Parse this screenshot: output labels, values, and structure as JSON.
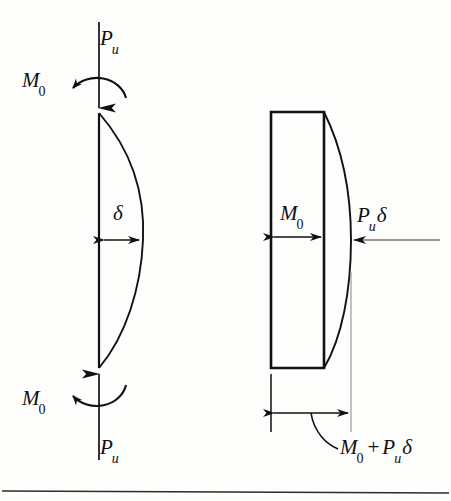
{
  "figure": {
    "background_color": "#fdfdfc",
    "ink_color": "#111111",
    "guide_color": "#9a9a9a",
    "labels": {
      "axial_load_top": "P",
      "axial_load_top_sub": "u",
      "end_moment_top": "M",
      "end_moment_top_sub": "0",
      "deflection": "δ",
      "end_moment_bottom": "M",
      "end_moment_bottom_sub": "0",
      "axial_load_bottom": "P",
      "axial_load_bottom_sub": "u",
      "primary_moment": "M",
      "primary_moment_sub": "0",
      "secondary_moment": "P",
      "secondary_moment_sub": "u",
      "secondary_moment_tail": "δ",
      "total_moment_first": "M",
      "total_moment_first_sub": "0",
      "total_moment_operator": "+",
      "total_moment_second": "P",
      "total_moment_second_sub": "u",
      "total_moment_tail": "δ"
    },
    "left_diagram": {
      "name": "deflected-column",
      "axis_x": 99,
      "top_y": 113,
      "bottom_y": 368,
      "max_bulge_x": 143,
      "deflection_arrow_y": 240
    },
    "right_diagram": {
      "name": "moment-diagram",
      "block_left_x": 271,
      "block_right_x": 324,
      "block_top_y": 112,
      "block_bottom_y": 368,
      "curve_max_x": 351,
      "moment_arrow_y": 237,
      "load_arrow_y": 240,
      "dimension_line_y": 413
    },
    "footer_rule": {
      "name": "page-rule",
      "y": 492
    }
  }
}
